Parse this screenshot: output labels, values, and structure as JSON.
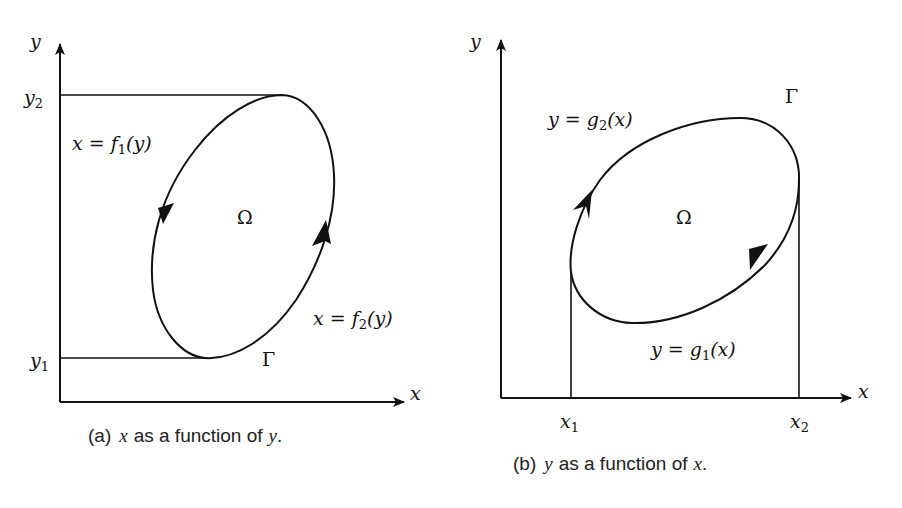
{
  "panel_a": {
    "caption_prefix": "(a)",
    "caption_var": "x",
    "caption_mid": "as a function of",
    "caption_var2": "y",
    "caption_end": ".",
    "x_axis_label": "x",
    "y_axis_label": "y",
    "y2_label": "y",
    "y2_sub": "2",
    "y1_label": "y",
    "y1_sub": "1",
    "f1_label_pre": "x = f",
    "f1_sub": "1",
    "f1_label_post": "(y)",
    "f2_label_pre": "x = f",
    "f2_sub": "2",
    "f2_label_post": "(y)",
    "region_label": "Ω",
    "boundary_label": "Γ"
  },
  "panel_b": {
    "caption_prefix": "(b)",
    "caption_var": "y",
    "caption_mid": "as a function of",
    "caption_var2": "x",
    "caption_end": ".",
    "x_axis_label": "x",
    "y_axis_label": "y",
    "x1_label": "x",
    "x1_sub": "1",
    "x2_label": "x",
    "x2_sub": "2",
    "g2_label_pre": "y = g",
    "g2_sub": "2",
    "g2_label_post": "(x)",
    "g1_label_pre": "y = g",
    "g1_sub": "1",
    "g1_label_post": "(x)",
    "region_label": "Ω",
    "boundary_label": "Γ"
  }
}
